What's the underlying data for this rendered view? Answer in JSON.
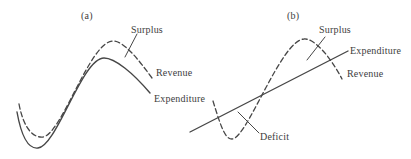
{
  "figure": {
    "background": "#ffffff",
    "ink": "#474747",
    "panels": [
      {
        "id": "a",
        "tag": "(a)",
        "labels": {
          "surplus": "Surplus",
          "revenue": "Revenue",
          "expenditure": "Expenditure"
        }
      },
      {
        "id": "b",
        "tag": "(b)",
        "labels": {
          "surplus": "Surplus",
          "expenditure": "Expenditure",
          "revenue": "Revenue",
          "deficit": "Deficit"
        }
      }
    ]
  }
}
